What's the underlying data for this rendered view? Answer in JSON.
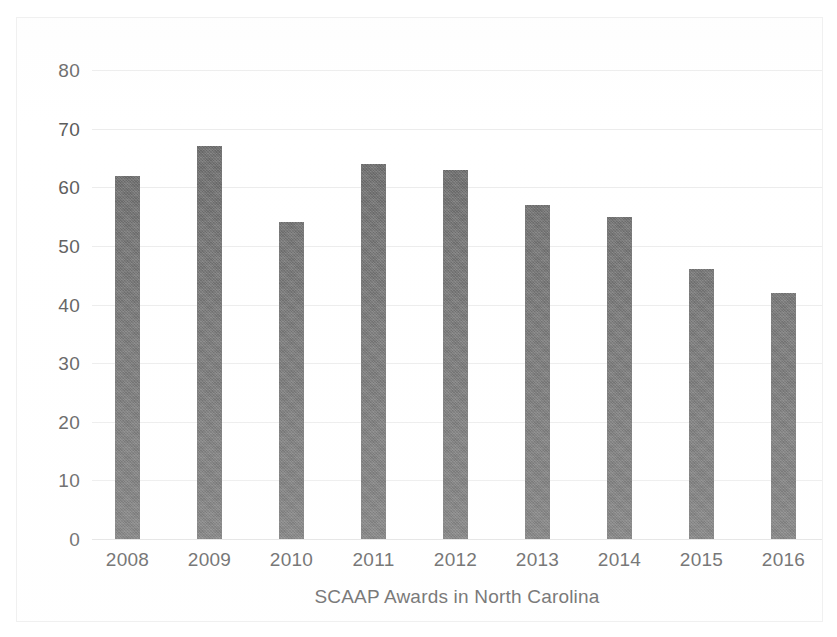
{
  "chart_data": {
    "type": "bar",
    "title": "",
    "xlabel": "SCAAP Awards in North Carolina",
    "ylabel": "",
    "categories": [
      "2008",
      "2009",
      "2010",
      "2011",
      "2012",
      "2013",
      "2014",
      "2015",
      "2016"
    ],
    "values": [
      62,
      67,
      54,
      64,
      63,
      57,
      55,
      46,
      42
    ],
    "ylim": [
      0,
      80
    ],
    "yticks": [
      "0",
      "10",
      "20",
      "30",
      "40",
      "50",
      "60",
      "70",
      "80"
    ],
    "ytick_values": [
      0,
      10,
      20,
      30,
      40,
      50,
      60,
      70,
      80
    ],
    "grid": true,
    "legend": false,
    "legend_position": "none",
    "series": [
      {
        "name": "SCAAP Awards in North Carolina",
        "values": [
          62,
          67,
          54,
          64,
          63,
          57,
          55,
          46,
          42
        ]
      }
    ],
    "colors": {
      "bar": "#6e6e6e",
      "gridline": "#ececec",
      "text": "#5b5b5b",
      "background": "#ffffff",
      "border": "#f0f0f0"
    }
  }
}
